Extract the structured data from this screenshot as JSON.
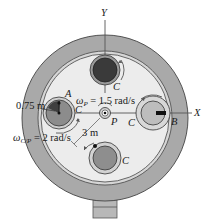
{
  "diagram": {
    "axes": {
      "x_label": "X",
      "y_label": "Y"
    },
    "points": {
      "center": "P",
      "A": "A",
      "B": "B",
      "gear": "C"
    },
    "annotations": {
      "omega_p_sym": "ω",
      "omega_p_sub": "P",
      "omega_p_val": " = 1.5 rad/s",
      "omega_cp_sym": "ω",
      "omega_cp_sub": "C/P",
      "omega_cp_val": " = 2 rad/s",
      "radius_small": "0.75 m",
      "radius_large": "3 m"
    },
    "colors": {
      "ring": "#a9a9a9",
      "plate": "#ececec",
      "gear_dark": "#3a3a3a",
      "gear_med": "#8c8c8c",
      "gear_light": "#bdbdbd"
    }
  }
}
